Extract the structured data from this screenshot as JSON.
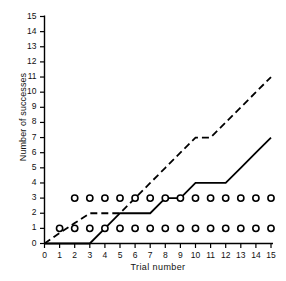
{
  "chart_data": {
    "type": "line",
    "title": "",
    "xlabel": "Trial  number",
    "ylabel": "Number of successes",
    "xlim": [
      0,
      15
    ],
    "ylim": [
      0,
      15
    ],
    "grid": false,
    "legend": "none",
    "xticks": [
      "0",
      "1",
      "2",
      "3",
      "4",
      "5",
      "6",
      "7",
      "8",
      "9",
      "10",
      "11",
      "12",
      "13",
      "14",
      "15"
    ],
    "yticks": [
      "0",
      "1",
      "2",
      "3",
      "4",
      "5",
      "6",
      "7",
      "8",
      "9",
      "10",
      "11",
      "12",
      "13",
      "14",
      "15"
    ],
    "series": [
      {
        "name": "dashed-cumulative-record",
        "style": "dashed",
        "x": [
          0,
          1,
          2,
          3,
          4,
          5,
          6,
          7,
          8,
          9,
          10,
          11,
          12,
          13,
          14,
          15
        ],
        "values": [
          0,
          0.7,
          1.35,
          2,
          2,
          2,
          3,
          4,
          5,
          6,
          7,
          7,
          8,
          9,
          10,
          11
        ]
      },
      {
        "name": "solid-cumulative-record",
        "style": "solid",
        "x": [
          0,
          1,
          2,
          3,
          4,
          5,
          6,
          7,
          8,
          9,
          10,
          11,
          12,
          13,
          14,
          15
        ],
        "values": [
          0,
          0,
          0,
          0,
          1,
          2,
          2,
          2,
          3,
          3,
          4,
          4,
          4,
          5,
          6,
          7
        ]
      }
    ],
    "markers": [
      {
        "name": "open-circles-level-1",
        "symbol": "open-circle",
        "y": 1,
        "x": [
          1,
          2,
          3,
          4,
          5,
          6,
          7,
          8,
          9,
          10,
          11,
          12,
          13,
          14,
          15
        ]
      },
      {
        "name": "open-circles-level-3",
        "symbol": "open-circle",
        "y": 3,
        "x": [
          2,
          3,
          4,
          5,
          6,
          7,
          8,
          9,
          10,
          11,
          12,
          13,
          14,
          15
        ]
      }
    ],
    "colors": {
      "axis": "#000000",
      "line": "#000000",
      "marker": "#000000",
      "background": "#ffffff"
    }
  }
}
